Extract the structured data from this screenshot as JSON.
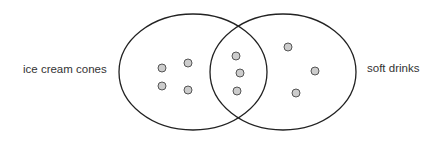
{
  "diagram": {
    "type": "venn",
    "sets": [
      {
        "label": "ice cream cones",
        "only_count": 4
      },
      {
        "label": "soft drinks",
        "only_count": 3
      }
    ],
    "intersection_count": 3,
    "colors": {
      "outline": "#222222",
      "dot_fill": "#cccccc",
      "dot_stroke": "#555555",
      "text": "#333333"
    }
  }
}
